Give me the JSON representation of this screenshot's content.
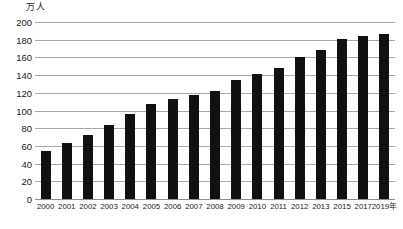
{
  "chart_data": {
    "type": "bar",
    "title": "",
    "subtitle": "",
    "xlabel": "",
    "ylabel": "万人",
    "unit_caption": "万人",
    "x_axis_suffix": "年",
    "categories": [
      "2000",
      "2001",
      "2002",
      "2003",
      "2004",
      "2005",
      "2006",
      "2007",
      "2008",
      "2009",
      "2010",
      "2011",
      "2012",
      "2013",
      "2015",
      "2017",
      "2019年"
    ],
    "values": [
      54,
      63,
      72,
      84,
      96,
      107,
      113,
      118,
      122,
      135,
      141,
      148,
      161,
      168,
      181,
      184,
      187
    ],
    "ylim": [
      0,
      200
    ],
    "ytick_step": 20,
    "yticks": [
      0,
      20,
      40,
      60,
      80,
      100,
      120,
      140,
      160,
      180,
      200
    ],
    "ytick_labels": [
      "0",
      "20",
      "40",
      "60",
      "80",
      "100",
      "120",
      "140",
      "160",
      "180",
      "200"
    ],
    "grid": true,
    "grid_axis": "y",
    "legend": false,
    "legend_position": "none",
    "series": [
      {
        "name": "",
        "values": [
          54,
          63,
          72,
          84,
          96,
          107,
          113,
          118,
          122,
          135,
          141,
          148,
          161,
          168,
          181,
          184,
          187
        ]
      }
    ]
  },
  "style": {
    "bar_color": "#111111",
    "grid_color": "#a9a9a9",
    "axis_color": "#8f8f8f",
    "text_color": "#1a1a1a",
    "background": "#ffffff"
  }
}
